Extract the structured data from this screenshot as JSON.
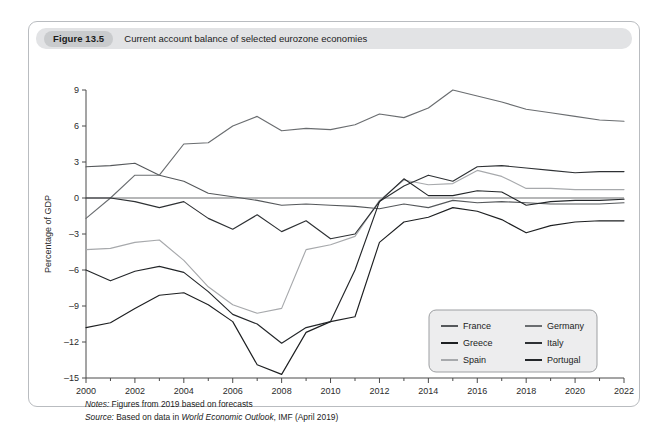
{
  "figure": {
    "number_label": "Figure 13.5",
    "title": "Current account balance of selected eurozone economies"
  },
  "notes": {
    "notes_prefix": "Notes:",
    "notes_text": "Figures from 2019 based on forecasts",
    "source_prefix": "Source:",
    "source_text_before": "Based on data in",
    "source_italic": "World Economic Outlook",
    "source_text_after": ", IMF (April 2019)"
  },
  "chart_data": {
    "type": "line",
    "title": "Current account balance of selected eurozone economies",
    "xlabel": "",
    "ylabel": "Percentage of GDP",
    "xlim": [
      2000,
      2022
    ],
    "ylim": [
      -15,
      9
    ],
    "yticks": [
      9,
      6,
      3,
      0,
      -3,
      -6,
      -9,
      -12,
      -15
    ],
    "xticks": [
      2000,
      2002,
      2004,
      2006,
      2008,
      2010,
      2012,
      2014,
      2016,
      2018,
      2020,
      2022
    ],
    "x": [
      2000,
      2001,
      2002,
      2003,
      2004,
      2005,
      2006,
      2007,
      2008,
      2009,
      2010,
      2011,
      2012,
      2013,
      2014,
      2015,
      2016,
      2017,
      2018,
      2019,
      2020,
      2021,
      2022
    ],
    "grid": false,
    "legend_position": "bottom-right",
    "legend_columns": 2,
    "series": [
      {
        "name": "France",
        "color": "#55585b",
        "values": [
          2.6,
          2.7,
          2.9,
          1.9,
          1.4,
          0.4,
          0.1,
          -0.2,
          -0.6,
          -0.5,
          -0.6,
          -0.7,
          -0.9,
          -0.5,
          -0.8,
          -0.2,
          -0.4,
          -0.3,
          -0.4,
          -0.5,
          -0.5,
          -0.5,
          -0.4
        ]
      },
      {
        "name": "Greece",
        "color": "#1d1f21",
        "values": [
          -10.8,
          -10.4,
          -9.2,
          -8.1,
          -7.9,
          -8.9,
          -10.3,
          -13.9,
          -14.7,
          -11.2,
          -10.3,
          -9.9,
          -3.7,
          -2.0,
          -1.6,
          -0.8,
          -1.1,
          -1.8,
          -2.9,
          -2.3,
          -2.0,
          -1.9,
          -1.9
        ]
      },
      {
        "name": "Spain",
        "color": "#a7a9ac",
        "values": [
          -4.3,
          -4.2,
          -3.7,
          -3.5,
          -5.2,
          -7.4,
          -8.9,
          -9.6,
          -9.2,
          -4.3,
          -3.9,
          -3.2,
          -0.2,
          1.5,
          1.1,
          1.2,
          2.3,
          1.8,
          0.8,
          0.8,
          0.7,
          0.7,
          0.7
        ]
      },
      {
        "name": "Germany",
        "color": "#6a6d70",
        "values": [
          -1.7,
          0.0,
          1.9,
          1.9,
          4.5,
          4.6,
          6.0,
          6.8,
          5.6,
          5.8,
          5.7,
          6.1,
          7.0,
          6.7,
          7.5,
          9.0,
          8.5,
          8.0,
          7.4,
          7.1,
          6.8,
          6.5,
          6.4
        ]
      },
      {
        "name": "Italy",
        "color": "#2e3134",
        "values": [
          0.0,
          0.0,
          -0.3,
          -0.8,
          -0.3,
          -1.7,
          -2.6,
          -1.4,
          -2.8,
          -1.9,
          -3.4,
          -3.0,
          -0.3,
          1.0,
          1.9,
          1.4,
          2.6,
          2.7,
          2.5,
          2.3,
          2.1,
          2.2,
          2.2
        ]
      },
      {
        "name": "Portugal",
        "color": "#232629",
        "values": [
          -6.0,
          -6.9,
          -6.1,
          -5.7,
          -6.2,
          -7.8,
          -9.7,
          -10.5,
          -12.1,
          -10.8,
          -10.3,
          -6.0,
          -0.3,
          1.6,
          0.2,
          0.2,
          0.6,
          0.5,
          -0.6,
          -0.3,
          -0.2,
          -0.2,
          -0.1
        ]
      }
    ]
  },
  "legend": {
    "entries": [
      {
        "label": "France"
      },
      {
        "label": "Germany"
      },
      {
        "label": "Greece"
      },
      {
        "label": "Italy"
      },
      {
        "label": "Spain"
      },
      {
        "label": "Portugal"
      }
    ]
  }
}
